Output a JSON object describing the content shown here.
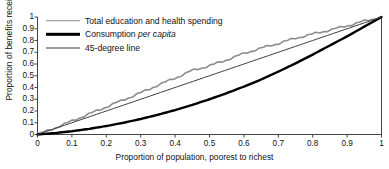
{
  "chart_data": {
    "type": "line",
    "title": "",
    "xlabel": "Proportion of population, poorest to richest",
    "ylabel": "Proportion of benefits received",
    "xlim": [
      0,
      1
    ],
    "ylim": [
      0,
      1
    ],
    "grid": false,
    "legend_position": "upper-left-inside",
    "xticks": [
      "0",
      "0.1",
      "0.2",
      "0.3",
      "0.4",
      "0.5",
      "0.6",
      "0.7",
      "0.8",
      "0.9",
      "1"
    ],
    "yticks": [
      "1",
      "0.9",
      "0.8",
      "0.7",
      "0.6",
      "0.5",
      "0.4",
      "0.3",
      "0.2",
      "0.1",
      "0"
    ],
    "x": [
      0,
      0.05,
      0.1,
      0.15,
      0.2,
      0.25,
      0.3,
      0.35,
      0.4,
      0.45,
      0.5,
      0.55,
      0.6,
      0.65,
      0.7,
      0.75,
      0.8,
      0.85,
      0.9,
      0.95,
      1
    ],
    "series": [
      {
        "name": "Total education and health spending",
        "color": "#8c8c8c",
        "width": 1.6,
        "values": [
          0,
          0.055,
          0.115,
          0.175,
          0.235,
          0.295,
          0.355,
          0.42,
          0.48,
          0.545,
          0.585,
          0.635,
          0.69,
          0.735,
          0.775,
          0.82,
          0.855,
          0.89,
          0.925,
          0.965,
          1
        ]
      },
      {
        "name": "Consumption per capita",
        "color": "#000000",
        "width": 2.4,
        "values": [
          0,
          0.012,
          0.028,
          0.048,
          0.072,
          0.1,
          0.132,
          0.168,
          0.208,
          0.252,
          0.3,
          0.352,
          0.408,
          0.468,
          0.535,
          0.605,
          0.68,
          0.758,
          0.835,
          0.918,
          1
        ]
      },
      {
        "name": "45-degree line",
        "color": "#3a3a3a",
        "width": 1,
        "values": [
          0,
          0.05,
          0.1,
          0.15,
          0.2,
          0.25,
          0.3,
          0.35,
          0.4,
          0.45,
          0.5,
          0.55,
          0.6,
          0.65,
          0.7,
          0.75,
          0.8,
          0.85,
          0.9,
          0.95,
          1
        ]
      }
    ]
  },
  "legend": {
    "items": [
      {
        "label": "Total education and health spending",
        "label_plain": "Total education and health spending",
        "label_italic": ""
      },
      {
        "label": "Consumption per capita",
        "label_plain": "Consumption ",
        "label_italic": "per capita"
      },
      {
        "label": "45-degree line",
        "label_plain": "45-degree line",
        "label_italic": ""
      }
    ]
  },
  "axes": {
    "x_title": "Proportion of population, poorest to richest",
    "y_title": "Proportion of benefits received"
  }
}
